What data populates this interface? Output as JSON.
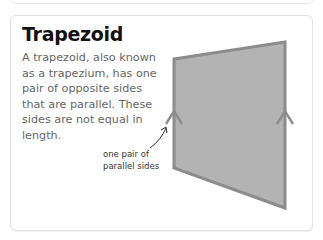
{
  "card": {
    "title": "Trapezoid",
    "description": "A trapezoid, also known as a trapezium, has one pair of opposite sides that are parallel. These sides are not equal in length."
  },
  "diagram": {
    "shape": "trapezoid",
    "fill_color": "#b3b3b3",
    "stroke_color": "#8c8c8c",
    "annotation": {
      "line1": "one pair of",
      "line2": "parallel sides"
    }
  }
}
